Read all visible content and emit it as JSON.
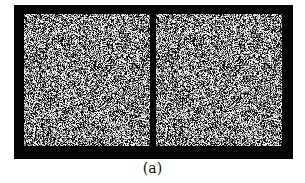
{
  "figure": {
    "caption": "(a)",
    "panels": [
      {
        "id": "left",
        "description": "random-dot stereogram left image"
      },
      {
        "id": "right",
        "description": "random-dot stereogram right image"
      }
    ],
    "colors": {
      "frame": "#050505",
      "background": "#ffffff"
    }
  }
}
